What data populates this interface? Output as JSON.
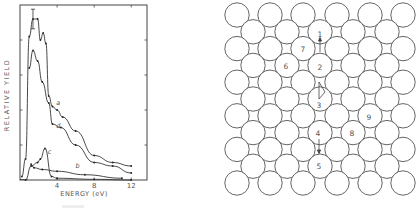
{
  "chart_data": {
    "type": "line",
    "title": "",
    "xlabel": "ENERGY (eV)",
    "ylabel": "RELATIVE YIELD",
    "xlim": [
      0,
      13.7
    ],
    "ylim": [
      0,
      5
    ],
    "xticks": [
      4,
      8,
      12
    ],
    "xtick_labels": [
      "4",
      "8",
      "12"
    ],
    "yticks": [
      1,
      2,
      3,
      4
    ],
    "ytick_labels": [],
    "grid": false,
    "legend": "inline-labels",
    "series": [
      {
        "name": "a",
        "label": "a",
        "x": [
          0.2,
          0.6,
          1.0,
          1.4,
          1.9,
          2.2,
          2.5,
          2.8,
          3.1,
          3.5,
          4.0,
          4.6,
          6.0,
          8.0,
          10.0,
          12.0
        ],
        "y": [
          0.1,
          0.6,
          4.1,
          4.6,
          4.6,
          4.0,
          4.2,
          3.9,
          2.4,
          2.1,
          2.0,
          1.8,
          1.4,
          0.7,
          0.5,
          0.4
        ],
        "error_bar": {
          "x": 1.4,
          "y": 4.6,
          "err": 0.28
        }
      },
      {
        "name": "d",
        "label": "d",
        "x": [
          1.0,
          1.4,
          1.9,
          2.4,
          3.1,
          3.5,
          4.4,
          6.0,
          8.0,
          10.0,
          12.0
        ],
        "y": [
          3.2,
          3.7,
          3.4,
          2.8,
          2.2,
          1.6,
          1.5,
          1.0,
          0.5,
          0.4,
          0.2
        ]
      },
      {
        "name": "c",
        "label": "c",
        "x": [
          0.6,
          1.2,
          1.9,
          2.2,
          2.7,
          3.4,
          4.0,
          8.0,
          12.0
        ],
        "y": [
          0.0,
          0.4,
          0.5,
          0.6,
          0.9,
          0.1,
          0.05,
          0.02,
          0.0
        ]
      },
      {
        "name": "b",
        "label": "b",
        "x": [
          1.2,
          1.5,
          2.4,
          4.0,
          7.0,
          11.0
        ],
        "y": [
          0.45,
          0.35,
          0.3,
          0.25,
          0.15,
          0.05
        ]
      }
    ]
  },
  "diagram": {
    "site_labels": [
      "1",
      "2",
      "3",
      "4",
      "5",
      "6",
      "7",
      "8",
      "9"
    ]
  },
  "caption": ""
}
